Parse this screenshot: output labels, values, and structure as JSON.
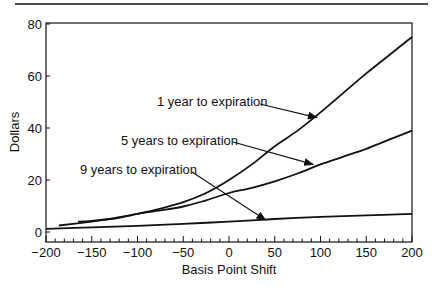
{
  "chart_data": {
    "type": "line",
    "title": "",
    "xlabel": "Basis Point Shift",
    "ylabel": "Dollars",
    "xlim": [
      -200,
      200
    ],
    "ylim": [
      -4,
      80
    ],
    "xticks": [
      -200,
      -150,
      -100,
      -50,
      0,
      50,
      100,
      150,
      200
    ],
    "xtick_labels": [
      "−200",
      "−150",
      "−100",
      "−50",
      "0",
      "50",
      "100",
      "150",
      "200"
    ],
    "yticks": [
      0,
      20,
      40,
      60,
      80
    ],
    "ytick_labels": [
      "0",
      "20",
      "40",
      "60",
      "80"
    ],
    "grid": false,
    "legend": "none (inline annotations with arrows)",
    "series": [
      {
        "name": "1 year to expiration",
        "x": [
          -165,
          -150,
          -125,
          -100,
          -75,
          -50,
          -25,
          0,
          25,
          50,
          75,
          100,
          125,
          150,
          175,
          200
        ],
        "values": [
          4,
          4.3,
          5.2,
          7,
          9,
          11.5,
          15,
          20,
          26,
          33,
          39,
          46,
          53.5,
          61,
          68,
          75
        ]
      },
      {
        "name": "5 years to expiration",
        "x": [
          -186,
          -150,
          -125,
          -100,
          -75,
          -50,
          -25,
          0,
          25,
          50,
          75,
          100,
          125,
          150,
          175,
          200
        ],
        "values": [
          2.5,
          4,
          5.3,
          7,
          8.3,
          9.8,
          12.2,
          15,
          17,
          19.5,
          22.5,
          26,
          29,
          32,
          35.5,
          39
        ]
      },
      {
        "name": "9 years to expiration",
        "x": [
          -200,
          -150,
          -100,
          -50,
          0,
          50,
          100,
          150,
          200
        ],
        "values": [
          1.2,
          1.8,
          2.4,
          3.1,
          4,
          5,
          5.8,
          6.4,
          7
        ]
      }
    ],
    "annotations": [
      {
        "text": "1 year to expiration",
        "arrow_to_x": 96,
        "arrow_to_y": 44
      },
      {
        "text": "5 years to expiration",
        "arrow_to_x": 92,
        "arrow_to_y": 26
      },
      {
        "text": "9 years to expiration",
        "arrow_to_x": 40,
        "arrow_to_y": 4.6
      }
    ]
  }
}
